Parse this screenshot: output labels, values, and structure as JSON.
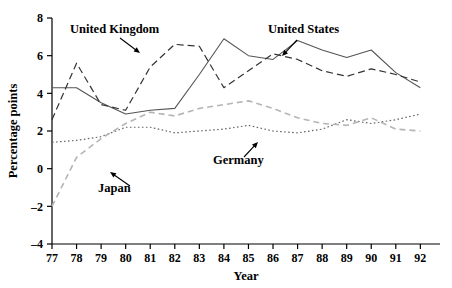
{
  "chart_data": {
    "type": "line",
    "title": "",
    "xlabel": "Year",
    "ylabel": "Percentage points",
    "xlim": [
      77,
      92.8
    ],
    "ylim": [
      -4,
      8
    ],
    "ytick_values": [
      -4,
      -2,
      0,
      2,
      4,
      6,
      8
    ],
    "ytick_labels": [
      "–4",
      "–2",
      "0",
      "2",
      "4",
      "6",
      "8"
    ],
    "xtick_values": [
      77,
      78,
      79,
      80,
      81,
      82,
      83,
      84,
      85,
      86,
      87,
      88,
      89,
      90,
      91,
      92
    ],
    "xtick_labels": [
      "77",
      "78",
      "79",
      "80",
      "81",
      "82",
      "83",
      "84",
      "85",
      "86",
      "87",
      "88",
      "89",
      "90",
      "91",
      "92"
    ],
    "grid": false,
    "legend": "annotations-on-plot",
    "x": [
      77,
      78,
      79,
      80,
      81,
      82,
      83,
      84,
      85,
      86,
      87,
      88,
      89,
      90,
      91,
      92
    ],
    "series": [
      {
        "name": "United States",
        "style": "solid",
        "color": "#555555",
        "width": 1.1,
        "values": [
          4.3,
          4.3,
          3.5,
          2.9,
          3.1,
          3.2,
          5.0,
          6.9,
          6.0,
          5.8,
          6.8,
          6.3,
          5.9,
          6.3,
          5.1,
          4.3
        ]
      },
      {
        "name": "United Kingdom",
        "style": "dashed",
        "color": "#333333",
        "width": 1.2,
        "values": [
          2.6,
          5.6,
          3.4,
          3.1,
          5.4,
          6.6,
          6.5,
          4.3,
          5.2,
          6.1,
          5.8,
          5.2,
          4.9,
          5.3,
          5.0,
          4.6
        ]
      },
      {
        "name": "Germany",
        "style": "dotted",
        "color": "#666666",
        "width": 1.2,
        "values": [
          1.4,
          1.5,
          1.7,
          2.2,
          2.2,
          1.9,
          2.0,
          2.1,
          2.3,
          2.0,
          1.9,
          2.1,
          2.6,
          2.4,
          2.6,
          2.9
        ]
      },
      {
        "name": "Japan",
        "style": "dashed-light",
        "color": "#b5b5b5",
        "width": 1.6,
        "values": [
          -2.0,
          0.6,
          1.6,
          2.4,
          3.0,
          2.8,
          3.2,
          3.4,
          3.6,
          3.2,
          2.7,
          2.4,
          2.3,
          2.7,
          2.1,
          2.0
        ]
      }
    ],
    "annotations": [
      {
        "text": "United Kingdom",
        "label_x": 70,
        "label_y": 33,
        "arrow_from_x": 120,
        "arrow_from_y": 38,
        "arrow_to_x": 140,
        "arrow_to_y": 53
      },
      {
        "text": "United States",
        "label_x": 268,
        "label_y": 33,
        "arrow_from_x": 297,
        "arrow_from_y": 40,
        "arrow_to_x": 282,
        "arrow_to_y": 56
      },
      {
        "text": "Germany",
        "label_x": 213,
        "label_y": 164,
        "arrow_from_x": 244,
        "arrow_from_y": 157,
        "arrow_to_x": 258,
        "arrow_to_y": 142
      },
      {
        "text": "Japan",
        "label_x": 98,
        "label_y": 192,
        "arrow_from_x": 130,
        "arrow_from_y": 186,
        "arrow_to_x": 110,
        "arrow_to_y": 172
      }
    ]
  },
  "colors": {
    "axis": "#000000",
    "background": "#ffffff",
    "us": "#555555",
    "uk": "#333333",
    "germany": "#666666",
    "japan": "#b5b5b5"
  }
}
